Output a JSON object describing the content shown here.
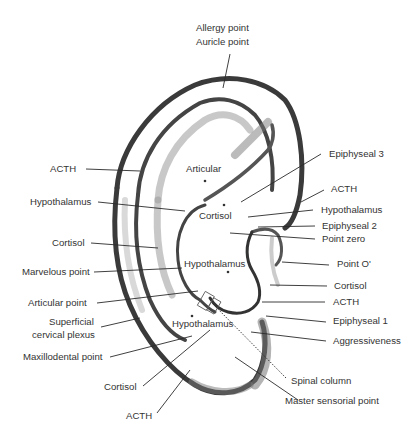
{
  "diagram": {
    "colors": {
      "line": "#2a2a2a",
      "text": "#333333",
      "shading": "#8a8a8a",
      "background": "#ffffff"
    },
    "labels": {
      "allergy_point": "Allergy point",
      "auricle_point": "Auricle point",
      "acth_upper_left": "ACTH",
      "hypothalamus_left": "Hypothalamus",
      "cortisol_left": "Cortisol",
      "marvelous_point": "Marvelous point",
      "articular_point": "Articular point",
      "superficial": "Superficial",
      "cervical_plexus": "cervical plexus",
      "maxillodental_point": "Maxillodental point",
      "cortisol_bottom": "Cortisol",
      "acth_bottom": "ACTH",
      "epiphyseal_3": "Epiphyseal 3",
      "acth_right_upper": "ACTH",
      "hypothalamus_right": "Hypothalamus",
      "epiphyseal_2": "Epiphyseal 2",
      "point_zero": "Point zero",
      "point_o_prime": "Point O'",
      "cortisol_right": "Cortisol",
      "acth_right_lower": "ACTH",
      "epiphyseal_1": "Epiphyseal 1",
      "aggressiveness": "Aggressiveness",
      "spinal_column": "Spinal column",
      "master_sensorial_point": "Master sensorial point",
      "articular_inner": "Articular",
      "cortisol_inner": "Cortisol",
      "hypothalamus_inner": "Hypothalamus",
      "hypothalamus_lobe": "Hypothalamus"
    }
  }
}
